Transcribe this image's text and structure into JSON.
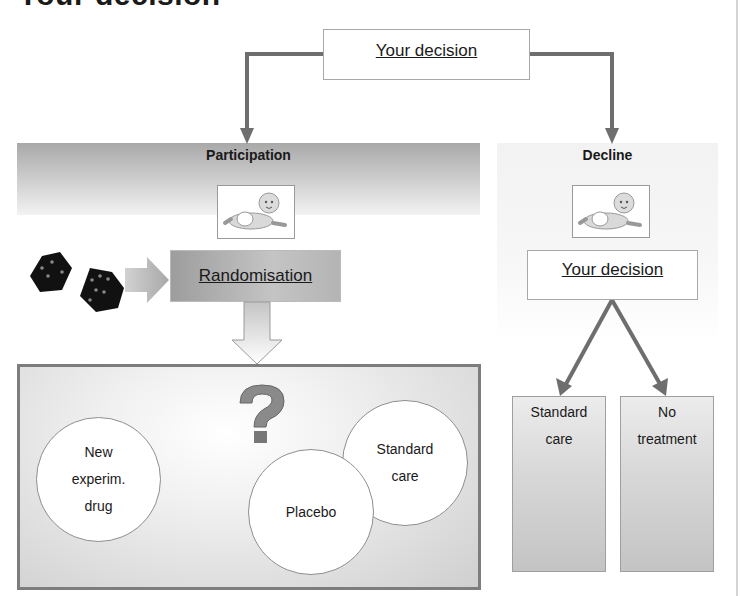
{
  "page": {
    "title": "Your decision"
  },
  "top_decision": {
    "label": "Your decision"
  },
  "participation": {
    "label": "Participation",
    "randomisation_label": "Randomisation",
    "options": [
      {
        "line1": "New",
        "line2": "experim.",
        "line3": "drug"
      },
      {
        "line1": "Placebo"
      },
      {
        "line1": "Standard",
        "line2": "care"
      }
    ],
    "question_icon": "question-mark-icon",
    "dice_icon": "dice-icon",
    "baby_icon": "baby-icon"
  },
  "decline": {
    "label": "Decline",
    "decision_label": "Your decision",
    "options": [
      {
        "line1": "Standard",
        "line2": "care"
      },
      {
        "line1": "No",
        "line2": "treatment"
      }
    ],
    "baby_icon": "baby-icon"
  },
  "colors": {
    "arrow": "#6e6e6e",
    "box_border": "#7d7d7d",
    "banner_top": "#a9a9a9"
  }
}
